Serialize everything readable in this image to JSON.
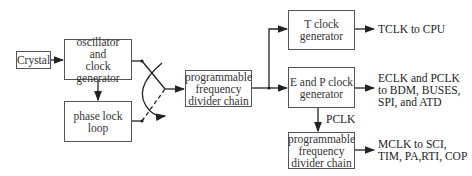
{
  "diagram": {
    "blocks": {
      "crystal": {
        "lines": [
          "Crystal"
        ]
      },
      "oscillator": {
        "lines": [
          "oscillator",
          "and",
          "clock generator"
        ]
      },
      "pll": {
        "lines": [
          "phase lock",
          "loop"
        ]
      },
      "divider_main": {
        "lines": [
          "programmable",
          "frequency",
          "divider chain"
        ]
      },
      "tclock": {
        "lines": [
          "T clock",
          "generator"
        ]
      },
      "epclock": {
        "lines": [
          "E and P clock",
          "generator"
        ]
      },
      "divider_sub": {
        "lines": [
          "programmable",
          "frequency",
          "divider chain"
        ]
      }
    },
    "outputs": {
      "tclk": {
        "lines": [
          "TCLK to CPU"
        ]
      },
      "eclk": {
        "lines": [
          "ECLK and PCLK",
          "to BDM, BUSES,",
          "SPI, and ATD"
        ]
      },
      "mclk": {
        "lines": [
          "MCLK to SCI,",
          "TIM, PA,RTI, COP"
        ]
      }
    },
    "edge_labels": {
      "pclk": "PCLK"
    },
    "colors": {
      "line": "#222222",
      "box_border": "#555555",
      "background": "#ffffff"
    }
  }
}
